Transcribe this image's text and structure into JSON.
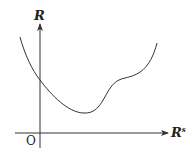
{
  "diagram": {
    "y_axis_label": "R",
    "x_axis_label": "R",
    "x_axis_label_superscript": "s",
    "origin_label": "O",
    "colors": {
      "line": "#333333",
      "background": "#ffffff"
    },
    "curve_points": [
      [
        20,
        38
      ],
      [
        40,
        80
      ],
      [
        83,
        113
      ],
      [
        100,
        105
      ],
      [
        113,
        83
      ],
      [
        125,
        78
      ],
      [
        140,
        73
      ],
      [
        157,
        43
      ]
    ]
  }
}
